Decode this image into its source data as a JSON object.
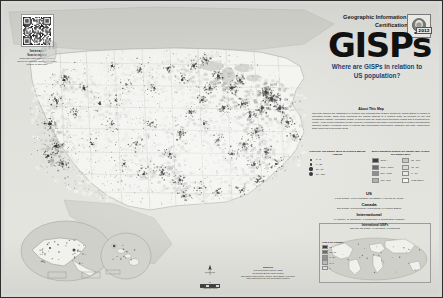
{
  "poster": {
    "organization_line1": "Geographic Information Systems",
    "organization_line2": "Certification Institute",
    "wordmark": "GISPs",
    "year": "2012",
    "seal_icon": "gisp-seal-icon",
    "callout": "Where are GISPs in relation to US population?"
  },
  "interact": {
    "label": "Interact",
    "qr_icon": "qr-code-icon",
    "hand_icon": "pointing-hand-icon",
    "caption_title": "Scan to explore",
    "caption_body": "Scan this code with your mobile device to view the interactive online version of this map."
  },
  "about": {
    "heading": "About This Map",
    "body": "This map displays the distribution of Certified GIS Professionals (GISPs) across the United States in relation to population density. Each point represents the mailing address of a certified GISP as recorded by the GIS Certification Institute. Population density is derived from the most recent decennial census and is symbolized by county. Areas of high population density generally correspond with higher concentrations of certified professionals, although notable exceptions occur in regions with concentrated government, academic and utility employment. Data current as of December 2012."
  },
  "legend": {
    "dots_heading": "GISPs per 100 Square Miles at Certified Mailing Address",
    "density_heading": "2010 Population Density per Square Mile (People per Square Mile)",
    "dots": [
      {
        "size": 1.6,
        "label": "1 - 5"
      },
      {
        "size": 2.4,
        "label": "6 - 20"
      },
      {
        "size": 3.2,
        "label": "21 - 50"
      },
      {
        "size": 4.2,
        "label": "51 - 120"
      }
    ],
    "density_left": [
      {
        "color": "#3f3f3f",
        "label": "5000 +"
      },
      {
        "color": "#6a6a6a",
        "label": "1000 - 5000"
      },
      {
        "color": "#8f8f8f",
        "label": "500 - 1000"
      },
      {
        "color": "#b0b0b0",
        "label": "100 - 500"
      }
    ],
    "density_right": [
      {
        "color": "#c6c6c6",
        "label": "50 - 100"
      },
      {
        "color": "#d8d8d8",
        "label": "10 - 50"
      },
      {
        "color": "#e8e8e8",
        "label": "1 - 10"
      },
      {
        "color": "#f5f5f5",
        "label": "Less than 1"
      }
    ]
  },
  "stats": {
    "us": {
      "heading": "US",
      "line": "6,001 GISPs   |   3,179 Counties   |   50 States   |   9,171 sq mi / GISP"
    },
    "canada": {
      "heading": "Canada",
      "line": "187 GISPs   |   13 Provinces   |   3 Territories   |   1 Federal District"
    },
    "international": {
      "heading": "International",
      "line": "94 GISPs   |   41 Countries   |   6 Continents   |   1 Certification Program"
    }
  },
  "insets": {
    "alaska": {
      "label": "Alaska",
      "scale": "0   200   400 mi"
    },
    "hawaii": {
      "label": "Hawaii",
      "scale": "0   100   200 mi"
    },
    "world": {
      "title": "International GISPs",
      "subtitle": "281 Non-US GISPs   |   41 Countries   |   6 Continents",
      "legend_heading": "GISPs per Country",
      "items": [
        {
          "color": "#3f3f3f",
          "label": "51 +"
        },
        {
          "color": "#6e6e6e",
          "label": "21 - 50"
        },
        {
          "color": "#949494",
          "label": "6 - 20"
        },
        {
          "color": "#bcbcbc",
          "label": "2 - 5"
        },
        {
          "color": "#dedede",
          "label": "1"
        }
      ]
    }
  },
  "credits": {
    "heading": "Sources",
    "line1": "GIS Certification Institute, 2012",
    "line2": "US Census Bureau, 2010 Census",
    "line3": "Esri Data & Maps, North America Albers Equal Area Conic",
    "line4": "Map produced by the GIS Certification Institute"
  },
  "northarrow": {
    "icon": "north-arrow-icon",
    "label": "N",
    "scale_label": "0    250    500 Miles"
  }
}
